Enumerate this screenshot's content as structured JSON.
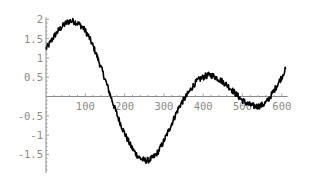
{
  "chart_data": {
    "type": "line",
    "title": "",
    "xlabel": "",
    "ylabel": "",
    "xlim": [
      0,
      610
    ],
    "ylim": [
      -1.85,
      2.0
    ],
    "grid": false,
    "legend": null,
    "x_ticks": [
      100,
      200,
      300,
      400,
      500,
      600
    ],
    "x_tick_labels": [
      "100",
      "200",
      "300",
      "400",
      "500",
      "600"
    ],
    "y_ticks": [
      2,
      1.5,
      1,
      0.5,
      -0.5,
      -1,
      -1.5
    ],
    "y_tick_labels": [
      "2",
      "1.5",
      "1",
      "0.5",
      "-0.5",
      "-1",
      "-1.5"
    ],
    "series": [
      {
        "name": "signal",
        "color": "#000000",
        "noise_amplitude": 0.08,
        "x": [
          0,
          20,
          40,
          60,
          80,
          100,
          120,
          140,
          160,
          180,
          200,
          220,
          240,
          260,
          280,
          300,
          320,
          340,
          360,
          380,
          400,
          420,
          440,
          460,
          480,
          500,
          520,
          540,
          560,
          580,
          600,
          610
        ],
        "values": [
          1.25,
          1.55,
          1.8,
          1.95,
          1.9,
          1.7,
          1.3,
          0.75,
          0.15,
          -0.45,
          -0.95,
          -1.35,
          -1.6,
          -1.65,
          -1.5,
          -1.15,
          -0.7,
          -0.25,
          0.05,
          0.35,
          0.5,
          0.55,
          0.45,
          0.3,
          0.1,
          -0.1,
          -0.22,
          -0.25,
          -0.15,
          0.15,
          0.5,
          0.7
        ]
      }
    ]
  },
  "axes": {
    "axis_color": "#8a8a8a"
  }
}
